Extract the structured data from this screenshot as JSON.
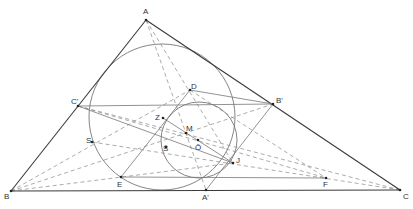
{
  "diagram": {
    "type": "geometry-construction",
    "colors": {
      "solid": "#3a3a3a",
      "thin": "#777777",
      "dashed": "#888888",
      "point": "#222222"
    },
    "points": [
      {
        "id": "A",
        "label": "A",
        "x": 146,
        "y": 20,
        "lx": 143,
        "ly": 14
      },
      {
        "id": "B",
        "label": "B",
        "x": 11,
        "y": 191,
        "lx": 4,
        "ly": 199
      },
      {
        "id": "C",
        "label": "C",
        "x": 400,
        "y": 190,
        "lx": 403,
        "ly": 199
      },
      {
        "id": "Cp",
        "label": "C'",
        "x": 78,
        "y": 106,
        "lx": 71,
        "ly": 104
      },
      {
        "id": "Bp",
        "label": "B'",
        "x": 273,
        "y": 104,
        "lx": 276,
        "ly": 103
      },
      {
        "id": "D",
        "label": "D",
        "x": 190,
        "y": 90,
        "lx": 191,
        "ly": 89
      },
      {
        "id": "Z",
        "label": "Z",
        "x": 163,
        "y": 118,
        "lx": 155,
        "ly": 120
      },
      {
        "id": "M",
        "label": "M",
        "x": 186,
        "y": 133,
        "lx": 186,
        "ly": 131
      },
      {
        "id": "S",
        "label": "S",
        "x": 92,
        "y": 142,
        "lx": 86,
        "ly": 143
      },
      {
        "id": "Sb",
        "label": "S̄",
        "x": 166,
        "y": 147,
        "lx": 163,
        "ly": 151
      },
      {
        "id": "Ob",
        "label": "Ō",
        "x": 198,
        "y": 140,
        "lx": 195,
        "ly": 150
      },
      {
        "id": "J",
        "label": "J",
        "x": 233,
        "y": 163,
        "lx": 236,
        "ly": 163
      },
      {
        "id": "E",
        "label": "E",
        "x": 121,
        "y": 177,
        "lx": 117,
        "ly": 187
      },
      {
        "id": "F",
        "label": "F",
        "x": 326,
        "y": 178,
        "lx": 323,
        "ly": 187
      },
      {
        "id": "Ap",
        "label": "A'",
        "x": 206,
        "y": 190,
        "lx": 202,
        "ly": 200
      }
    ],
    "circles": [
      {
        "name": "incircle-large",
        "cx": 162,
        "cy": 117,
        "r": 73
      },
      {
        "name": "circle-small",
        "cx": 199,
        "cy": 140,
        "r": 38
      }
    ],
    "solid_lines": [
      [
        "A",
        "B"
      ],
      [
        "A",
        "C"
      ],
      [
        "B",
        "C"
      ],
      [
        "Cp",
        "Bp"
      ],
      [
        "E",
        "F"
      ],
      [
        "Cp",
        "J"
      ],
      [
        "D",
        "Bp"
      ],
      [
        "D",
        "E"
      ],
      [
        "Bp",
        "Ap"
      ],
      [
        "Z",
        "J"
      ]
    ],
    "dashed_lines": [
      [
        "A",
        "Ap"
      ],
      [
        "A",
        "J"
      ],
      [
        "B",
        "Bp"
      ],
      [
        "C",
        "Cp"
      ],
      [
        "B",
        "J"
      ],
      [
        "C",
        "S"
      ],
      [
        "Cp",
        "F"
      ],
      [
        "B",
        "D"
      ],
      [
        "D",
        "F"
      ]
    ]
  }
}
